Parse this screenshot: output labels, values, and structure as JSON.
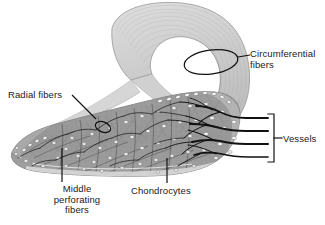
{
  "figure": {
    "type": "anatomical-illustration",
    "background_color": "#ffffff",
    "line_color": "#111111",
    "palette": {
      "hook_light": "#d6d6d6",
      "hook_mid": "#c2c2c2",
      "hook_edge": "#9a9a9a",
      "body_mid": "#9e9e9e",
      "body_dark": "#7a7a7a",
      "body_light": "#c8c8c8",
      "lacuna": "#f2f2f2",
      "vessel": "#141414",
      "leader": "#111111"
    }
  },
  "labels": {
    "circumferential": {
      "line1": "Circumferential",
      "line2": "fibers",
      "text": "Circumferential fibers",
      "marker": "ellipse-annotation"
    },
    "radial": {
      "text": "Radial fibers",
      "marker": "ellipse-annotation"
    },
    "middle_perforating": {
      "line1": "Middle",
      "line2": "perforating",
      "line3": "fibers",
      "text": "Middle perforating fibers",
      "marker": "straight-leader"
    },
    "chondrocytes": {
      "text": "Chondrocytes",
      "marker": "straight-leader"
    },
    "vessels": {
      "text": "Vessels",
      "marker": "bracket"
    }
  },
  "structures": {
    "upper_hook": "curved circumferential fiber sheet",
    "body_wedge": "fibrocartilage body with chondrocyte lacunae",
    "vessel_count": 4,
    "lacunae_description": "white oval chondrocyte lacunae"
  }
}
